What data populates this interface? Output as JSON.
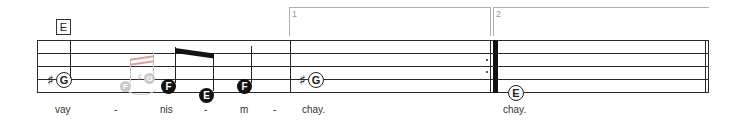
{
  "rehearsal_mark": "E",
  "voltas": [
    {
      "number": "1"
    },
    {
      "number": "2"
    }
  ],
  "notes": {
    "n1": {
      "letter": "G",
      "accidental": "♯"
    },
    "ghost1": {
      "letter": "F"
    },
    "ghost2": {
      "letter": "G",
      "accidental": "♯"
    },
    "n2": {
      "letter": "F"
    },
    "n3": {
      "letter": "E"
    },
    "n4": {
      "letter": "F"
    },
    "n5": {
      "letter": "G",
      "accidental": "♯"
    },
    "n6": {
      "letter": "E"
    }
  },
  "lyrics": [
    "vay",
    "-",
    "nis",
    "-",
    "m",
    "-",
    "chay.",
    "chay."
  ],
  "colors": {
    "ink": "#222222",
    "ghost": "#c8c8c8",
    "volta": "#b0b0b0"
  }
}
